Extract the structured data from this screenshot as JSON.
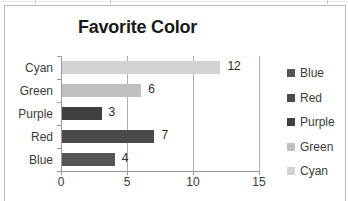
{
  "chart_data": {
    "type": "bar",
    "orientation": "horizontal",
    "title": "Favorite Color",
    "xlabel": "",
    "ylabel": "",
    "categories": [
      "Cyan",
      "Green",
      "Purple",
      "Red",
      "Blue"
    ],
    "values": [
      12,
      6,
      3,
      7,
      4
    ],
    "data_labels": [
      "12",
      "6",
      "3",
      "7",
      "4"
    ],
    "bar_colors": [
      "#d2d2d2",
      "#c0c0c0",
      "#404040",
      "#4a4a4a",
      "#555555"
    ],
    "xlim": [
      0,
      15
    ],
    "xticks": [
      0,
      5,
      10,
      15
    ],
    "xtick_labels": [
      "0",
      "5",
      "10",
      "15"
    ],
    "gridlines": [
      5,
      10,
      15
    ],
    "grid": true,
    "legend_position": "right",
    "legend": [
      {
        "label": "Blue",
        "color": "#555555"
      },
      {
        "label": "Red",
        "color": "#4a4a4a"
      },
      {
        "label": "Purple",
        "color": "#404040"
      },
      {
        "label": "Green",
        "color": "#c0c0c0"
      },
      {
        "label": "Cyan",
        "color": "#d2d2d2"
      }
    ]
  }
}
